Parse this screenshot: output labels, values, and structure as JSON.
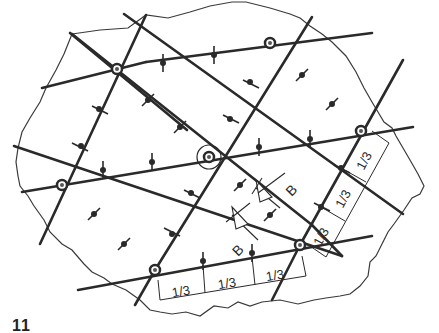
{
  "figure": {
    "label": "11",
    "colors": {
      "line": "#2a2a2a",
      "outline": "#3a3a3a",
      "background": "#ffffff"
    }
  },
  "grid": {
    "nodes": [
      {
        "id": "n1",
        "x": 117,
        "y": 69
      },
      {
        "id": "n2",
        "x": 270,
        "y": 43
      },
      {
        "id": "n3",
        "x": 62,
        "y": 185
      },
      {
        "id": "n4",
        "x": 209,
        "y": 157,
        "circled": true
      },
      {
        "id": "n5",
        "x": 361,
        "y": 131
      },
      {
        "id": "n6",
        "x": 155,
        "y": 270
      },
      {
        "id": "n7",
        "x": 300,
        "y": 245
      }
    ]
  },
  "dimensions": {
    "bottom": [
      "1/3",
      "1/3",
      "1/3"
    ],
    "right": [
      "1/3",
      "1/3",
      "1/3"
    ]
  },
  "section_markers": [
    {
      "label": "B",
      "position": "upper"
    },
    {
      "label": "B",
      "position": "lower"
    }
  ]
}
